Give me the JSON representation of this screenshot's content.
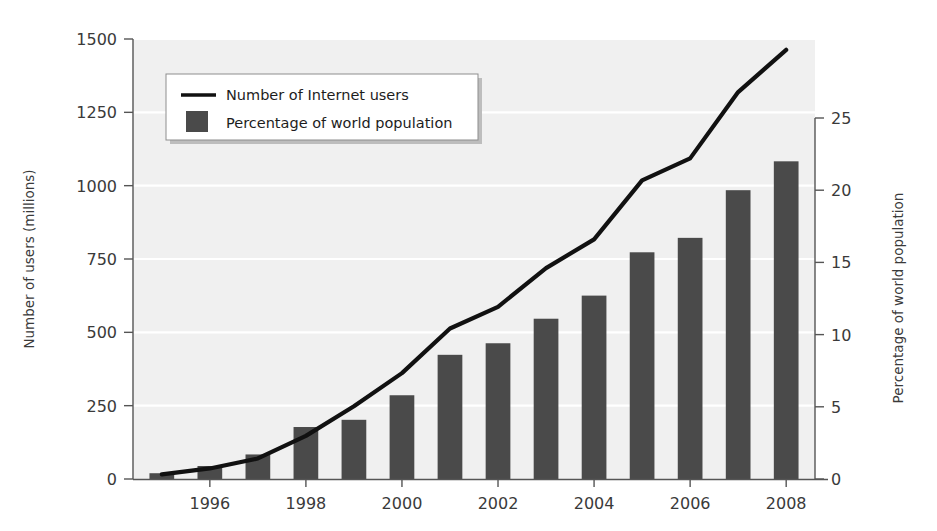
{
  "chart_data": {
    "type": "bar",
    "title": "",
    "subtitle": "",
    "xlabel": "",
    "ylabel": "Number of users (millions)",
    "y2label": "Percentage of world population",
    "grid": true,
    "legend_position": "upper-left",
    "xlim": [
      1994.4,
      2008.6
    ],
    "ylim": [
      0,
      1500
    ],
    "y2lim": [
      0,
      25
    ],
    "x": [
      1995,
      1996,
      1997,
      1998,
      1999,
      2000,
      2001,
      2002,
      2003,
      2004,
      2005,
      2006,
      2007,
      2008
    ],
    "categories": [
      "1995",
      "1996",
      "1997",
      "1998",
      "1999",
      "2000",
      "2001",
      "2002",
      "2003",
      "2004",
      "2005",
      "2006",
      "2007",
      "2008"
    ],
    "xticks": [
      1996,
      1998,
      2000,
      2002,
      2004,
      2006,
      2008
    ],
    "xticklabels": [
      "1996",
      "1998",
      "2000",
      "2002",
      "2004",
      "2006",
      "2008"
    ],
    "yticks": [
      0,
      250,
      500,
      750,
      1000,
      1250,
      1500
    ],
    "yticklabels": [
      "0",
      "250",
      "500",
      "750",
      "1000",
      "1250",
      "1500"
    ],
    "y2ticks": [
      0,
      5,
      10,
      15,
      20,
      25
    ],
    "y2ticklabels": [
      "0",
      "5",
      "10",
      "15",
      "20",
      "25"
    ],
    "series": [
      {
        "name": "Number of Internet users",
        "type": "line",
        "axis": "left",
        "unit": "millions",
        "color": "#111111",
        "values": [
          16,
          36,
          70,
          147,
          248,
          361,
          513,
          587,
          719,
          817,
          1018,
          1093,
          1319,
          1463
        ]
      },
      {
        "name": "Percentage of world population",
        "type": "bar",
        "axis": "right",
        "unit": "percent",
        "color": "#4a4a4a",
        "values": [
          0.4,
          0.9,
          1.7,
          3.6,
          4.1,
          5.8,
          8.6,
          9.4,
          11.1,
          12.7,
          15.7,
          16.7,
          20.0,
          22.0
        ]
      }
    ],
    "legend": [
      {
        "label": "Number of Internet users",
        "marker": "line",
        "color": "#111111"
      },
      {
        "label": "Percentage of world population",
        "marker": "square",
        "color": "#4a4a4a"
      }
    ],
    "colors": {
      "bar": "#4a4a4a",
      "line": "#111111",
      "plot_background": "#f0f0f0",
      "grid": "#ffffff",
      "axis": "#555555",
      "text": "#3a3a3a",
      "legend_background": "#ffffff"
    }
  }
}
